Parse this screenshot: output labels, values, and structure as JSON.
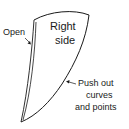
{
  "diagram": {
    "shape_label_line1": "Right",
    "shape_label_line2": "side",
    "open_label": "Open",
    "push_label_line1": "Push out",
    "push_label_line2": "curves",
    "push_label_line3": "and points",
    "stroke_color": "#1a1a1a",
    "background": "#ffffff"
  }
}
